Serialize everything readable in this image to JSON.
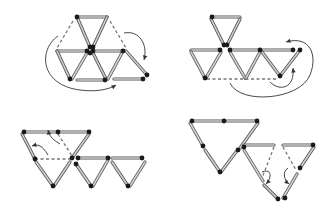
{
  "colors": {
    "background": "#ffffff",
    "match_body": "#cfcfcf",
    "match_edge": "#555555",
    "match_head": "#1a1a1a",
    "dashed": "#777777",
    "arrow": "#333333"
  },
  "panels": [
    {
      "id": "panel-1",
      "description": "Hexagon of six triangles with one triangle swung to the right; arrows show matches moving",
      "matches": [
        [
          [
            77,
            17
          ],
          [
            107,
            17
          ]
        ],
        [
          [
            77,
            17
          ],
          [
            90,
            47
          ]
        ],
        [
          [
            107,
            17
          ],
          [
            93,
            47
          ]
        ],
        [
          [
            57,
            51
          ],
          [
            87,
            51
          ]
        ],
        [
          [
            93,
            51
          ],
          [
            123,
            51
          ]
        ],
        [
          [
            57,
            51
          ],
          [
            70,
            79
          ]
        ],
        [
          [
            87,
            53
          ],
          [
            72,
            79
          ]
        ],
        [
          [
            93,
            53
          ],
          [
            106,
            79
          ]
        ],
        [
          [
            77,
            80
          ],
          [
            105,
            80
          ]
        ],
        [
          [
            123,
            51
          ],
          [
            108,
            79
          ]
        ],
        [
          [
            114,
            79
          ],
          [
            143,
            79
          ]
        ],
        [
          [
            126,
            51
          ],
          [
            147,
            75
          ]
        ]
      ],
      "heads": [
        [
          77,
          17
        ],
        [
          90,
          47
        ],
        [
          93,
          47
        ],
        [
          87,
          51
        ],
        [
          93,
          51
        ],
        [
          123,
          51
        ],
        [
          70,
          79
        ],
        [
          105,
          80
        ],
        [
          143,
          79
        ],
        [
          147,
          75
        ],
        [
          90,
          53
        ]
      ],
      "dashed": [
        [
          [
            73,
            21
          ],
          [
            57,
            48
          ]
        ],
        [
          [
            110,
            21
          ],
          [
            126,
            48
          ]
        ]
      ],
      "arrows": [
        {
          "d": "M58,36 C38,50 40,85 80,90 C95,92 108,90 116,85",
          "head": [
            116,
            85
          ]
        },
        {
          "d": "M124,33 C140,30 148,45 144,60",
          "head": [
            144,
            60
          ]
        }
      ]
    },
    {
      "id": "panel-2",
      "description": "Three-triangle star with a chain of triangles to the right; dashed base and arrows",
      "matches": [
        [
          [
            212,
            17
          ],
          [
            240,
            17
          ]
        ],
        [
          [
            211,
            19
          ],
          [
            224,
            45
          ]
        ],
        [
          [
            240,
            19
          ],
          [
            227,
            45
          ]
        ],
        [
          [
            191,
            50
          ],
          [
            220,
            50
          ]
        ],
        [
          [
            230,
            50
          ],
          [
            260,
            50
          ]
        ],
        [
          [
            191,
            52
          ],
          [
            205,
            78
          ]
        ],
        [
          [
            221,
            52
          ],
          [
            206,
            78
          ]
        ],
        [
          [
            230,
            52
          ],
          [
            245,
            78
          ]
        ],
        [
          [
            260,
            52
          ],
          [
            246,
            78
          ]
        ],
        [
          [
            263,
            50
          ],
          [
            293,
            50
          ]
        ],
        [
          [
            262,
            52
          ],
          [
            280,
            76
          ]
        ],
        [
          [
            300,
            50
          ],
          [
            280,
            76
          ]
        ]
      ],
      "heads": [
        [
          212,
          17
        ],
        [
          224,
          45
        ],
        [
          227,
          45
        ],
        [
          220,
          50
        ],
        [
          230,
          50
        ],
        [
          205,
          78
        ],
        [
          293,
          50
        ],
        [
          300,
          50
        ],
        [
          280,
          76
        ],
        [
          260,
          50
        ]
      ],
      "dashed": [
        [
          [
            207,
            79
          ],
          [
            278,
            79
          ]
        ]
      ],
      "arrows": [
        {
          "d": "M230,83 C240,105 300,100 310,75 C318,55 310,35 286,42",
          "head": [
            286,
            42
          ]
        },
        {
          "d": "M270,82 C280,92 295,88 293,68",
          "head": [
            293,
            68
          ]
        }
      ]
    },
    {
      "id": "panel-3",
      "description": "Large triangle with two small triangles; curved arrows at upper left",
      "matches": [
        [
          [
            24,
            132
          ],
          [
            57,
            132
          ]
        ],
        [
          [
            58,
            132
          ],
          [
            89,
            132
          ]
        ],
        [
          [
            22,
            134
          ],
          [
            35,
            159
          ]
        ],
        [
          [
            36,
            162
          ],
          [
            53,
            186
          ]
        ],
        [
          [
            89,
            134
          ],
          [
            72,
            158
          ]
        ],
        [
          [
            70,
            162
          ],
          [
            54,
            186
          ]
        ],
        [
          [
            78,
            158
          ],
          [
            108,
            158
          ]
        ],
        [
          [
            112,
            158
          ],
          [
            142,
            158
          ]
        ],
        [
          [
            76,
            164
          ],
          [
            91,
            186
          ]
        ],
        [
          [
            108,
            160
          ],
          [
            93,
            186
          ]
        ],
        [
          [
            112,
            162
          ],
          [
            128,
            186
          ]
        ],
        [
          [
            145,
            162
          ],
          [
            130,
            186
          ]
        ]
      ],
      "heads": [
        [
          24,
          132
        ],
        [
          58,
          132
        ],
        [
          89,
          132
        ],
        [
          35,
          159
        ],
        [
          72,
          158
        ],
        [
          78,
          158
        ],
        [
          108,
          158
        ],
        [
          142,
          158
        ],
        [
          53,
          186
        ],
        [
          91,
          186
        ],
        [
          128,
          186
        ],
        [
          76,
          164
        ]
      ],
      "dashed": [
        [
          [
            35,
            159
          ],
          [
            70,
            159
          ]
        ],
        [
          [
            58,
            134
          ],
          [
            72,
            156
          ]
        ]
      ],
      "arrows": [
        {
          "d": "M48,155 C42,145 38,144 32,146",
          "head": [
            32,
            146
          ]
        },
        {
          "d": "M60,144 C54,140 50,138 48,130",
          "head": [
            48,
            130
          ]
        }
      ]
    },
    {
      "id": "panel-4",
      "description": "Large triangle and adjoining triangle; dashed matches with downward curved arrows",
      "matches": [
        [
          [
            192,
            121
          ],
          [
            222,
            121
          ]
        ],
        [
          [
            227,
            121
          ],
          [
            257,
            121
          ]
        ],
        [
          [
            190,
            123
          ],
          [
            203,
            146
          ]
        ],
        [
          [
            205,
            150
          ],
          [
            220,
            172
          ]
        ],
        [
          [
            258,
            123
          ],
          [
            240,
            148
          ]
        ],
        [
          [
            236,
            152
          ],
          [
            221,
            172
          ]
        ],
        [
          [
            244,
            145
          ],
          [
            274,
            145
          ]
        ],
        [
          [
            283,
            145
          ],
          [
            313,
            145
          ]
        ],
        [
          [
            244,
            150
          ],
          [
            263,
            181
          ]
        ],
        [
          [
            314,
            147
          ],
          [
            300,
            168
          ]
        ],
        [
          [
            297,
            174
          ],
          [
            283,
            198
          ]
        ],
        [
          [
            264,
            185
          ],
          [
            278,
            199
          ]
        ]
      ],
      "heads": [
        [
          192,
          121
        ],
        [
          224,
          121
        ],
        [
          257,
          121
        ],
        [
          203,
          146
        ],
        [
          238,
          150
        ],
        [
          220,
          172
        ],
        [
          244,
          147
        ],
        [
          313,
          145
        ],
        [
          300,
          168
        ],
        [
          278,
          199
        ],
        [
          285,
          198
        ]
      ],
      "dashed": [
        [
          [
            274,
            147
          ],
          [
            262,
            178
          ]
        ],
        [
          [
            283,
            147
          ],
          [
            296,
            170
          ]
        ]
      ],
      "arrows": [
        {
          "d": "M262,172 C272,168 272,178 266,184",
          "head": [
            266,
            184
          ]
        },
        {
          "d": "M288,168 C282,172 284,180 289,184",
          "head": [
            289,
            184
          ]
        }
      ]
    }
  ]
}
